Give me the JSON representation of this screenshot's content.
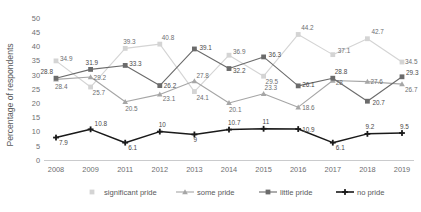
{
  "axes": {
    "ylabel": "Percentage of respondents",
    "yticks": [
      "0",
      "5",
      "10",
      "15",
      "20",
      "25",
      "30",
      "35",
      "40",
      "45",
      "50"
    ],
    "xlabel": ""
  },
  "legend": {
    "items": [
      {
        "label": "significant pride",
        "color": "#d4d4d4",
        "marker": "square"
      },
      {
        "label": "some pride",
        "color": "#a6a6a6",
        "marker": "triangle"
      },
      {
        "label": "little pride",
        "color": "#6b6b6b",
        "marker": "square"
      },
      {
        "label": "no pride",
        "color": "#1a1a1a",
        "marker": "plus"
      }
    ]
  },
  "chart_data": {
    "type": "line",
    "title": "",
    "xlabel": "",
    "ylabel": "Percentage of respondents",
    "ylim": [
      0,
      50
    ],
    "grid": false,
    "legend_position": "bottom",
    "categories": [
      "2008",
      "2009",
      "2011",
      "2012",
      "2013",
      "2014",
      "2015",
      "2016",
      "2017",
      "2018",
      "2019"
    ],
    "series": [
      {
        "name": "significant pride",
        "color": "#d4d4d4",
        "values": [
          34.9,
          25.7,
          39.3,
          40.8,
          24.1,
          36.9,
          29.5,
          44.2,
          37.1,
          42.7,
          34.5
        ]
      },
      {
        "name": "some pride",
        "color": "#a6a6a6",
        "values": [
          28.4,
          29.2,
          20.5,
          23.1,
          27.8,
          20.1,
          23.3,
          18.6,
          28.0,
          27.6,
          26.7
        ]
      },
      {
        "name": "little pride",
        "color": "#6b6b6b",
        "values": [
          28.8,
          31.9,
          33.3,
          26.2,
          39.1,
          32.2,
          36.3,
          26.1,
          28.8,
          20.7,
          29.3
        ]
      },
      {
        "name": "no pride",
        "color": "#1a1a1a",
        "values": [
          7.9,
          10.8,
          6.1,
          10.0,
          9.0,
          10.7,
          11.0,
          10.9,
          6.1,
          9.2,
          9.5
        ]
      }
    ]
  },
  "labels": {
    "significant_pride": [
      "34.9",
      "25.7",
      "39.3",
      "40.8",
      "24.1",
      "36.9",
      "29.5",
      "44.2",
      "37.1",
      "42.7",
      "34.5"
    ],
    "some_pride": [
      "28.4",
      "29.2",
      "20.5",
      "23.1",
      "27.8",
      "20.1",
      "23.3",
      "18.6",
      "28",
      "27.6",
      "26.7"
    ],
    "little_pride": [
      "28.8",
      "31.9",
      "33.3",
      "26.2",
      "39.1",
      "32.2",
      "36.3",
      "26.1",
      "28.8",
      "20.7",
      "29.3"
    ],
    "no_pride": [
      "7.9",
      "10.8",
      "6.1",
      "10",
      "9",
      "10.7",
      "11",
      "10.9",
      "6.1",
      "9.2",
      "9.5"
    ]
  }
}
